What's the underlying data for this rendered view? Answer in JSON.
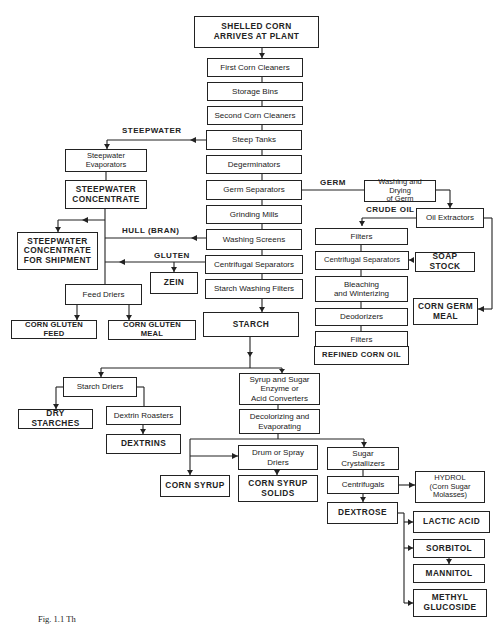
{
  "diagram": {
    "nodes": {
      "shelled_corn": "SHELLED CORN\nARRIVES AT PLANT",
      "first_cleaners": "First Corn Cleaners",
      "storage_bins": "Storage Bins",
      "second_cleaners": "Second Corn Cleaners",
      "steep_tanks": "Steep Tanks",
      "degerminators": "Degerminators",
      "germ_separators": "Germ Separators",
      "grinding_mills": "Grinding Mills",
      "washing_screens": "Washing Screens",
      "centrifugal_separators": "Centrifugal Separators",
      "starch_washing_filters": "Starch Washing Filters",
      "starch": "STARCH",
      "steepwater_evaporators": "Steepwater\nEvaporators",
      "steepwater_concentrate": "STEEPWATER\nCONCENTRATE",
      "steepwater_shipment": "STEEPWATER\nCONCENTRATE\nFOR SHIPMENT",
      "zein": "ZEIN",
      "feed_driers": "Feed Driers",
      "corn_gluten_feed": "CORN GLUTEN FEED",
      "corn_gluten_meal": "CORN GLUTEN MEAL",
      "washing_drying_germ": "Washing and Drying\nof Germ",
      "oil_extractors": "Oil Extractors",
      "oil_filters_1": "Filters",
      "oil_centrifugal_separators": "Centrifugal Separators",
      "soap_stock": "SOAP STOCK",
      "bleaching": "Bleaching\nand Winterizing",
      "deodorizers": "Deodorizers",
      "oil_filters_2": "Filters",
      "refined_corn_oil": "REFINED CORN OIL",
      "corn_germ_meal": "CORN GERM\nMEAL",
      "starch_driers": "Starch Driers",
      "dry_starches": "DRY STARCHES",
      "dextrin_roasters": "Dextrin Roasters",
      "dextrins": "DEXTRINS",
      "syrup_converters": "Syrup and Sugar\nEnzyme or\nAcid Converters",
      "decolorizing": "Decolorizing and\nEvaporating",
      "corn_syrup": "CORN SYRUP",
      "drum_driers": "Drum or Spray\nDriers",
      "corn_syrup_solids": "CORN SYRUP\nSOLIDS",
      "sugar_crystallizers": "Sugar\nCrystallizers",
      "centrifugals": "Centrifugals",
      "hydrol": "HYDROL\n(Corn Sugar\nMolasses)",
      "dextrose": "DEXTROSE",
      "lactic_acid": "LACTIC ACID",
      "sorbitol": "SORBITOL",
      "mannitol": "MANNITOL",
      "methyl_glucoside": "METHYL\nGLUCOSIDE"
    },
    "edge_labels": {
      "steepwater": "STEEPWATER",
      "germ": "GERM",
      "crude_oil": "CRUDE OIL",
      "hull_bran": "HULL (BRAN)",
      "gluten": "GLUTEN"
    },
    "caption": "Fig. 1.1 Th"
  }
}
